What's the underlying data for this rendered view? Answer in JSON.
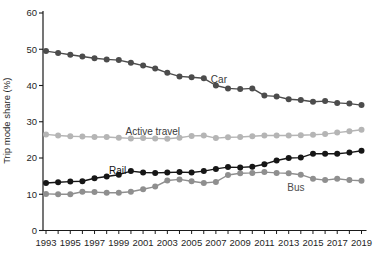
{
  "chart_data": {
    "type": "line",
    "title": "",
    "xlabel": "",
    "ylabel": "Trip mode share (%)",
    "ylim": [
      0,
      60
    ],
    "yticks": [
      0,
      10,
      20,
      30,
      40,
      50,
      60
    ],
    "xlim": [
      1993,
      2019
    ],
    "xtick_labels": [
      1993,
      1995,
      1997,
      1999,
      2001,
      2003,
      2005,
      2007,
      2009,
      2011,
      2013,
      2015,
      2017,
      2019
    ],
    "grid": false,
    "legend": "inline-annotations",
    "x": [
      1993,
      1994,
      1995,
      1996,
      1997,
      1998,
      1999,
      2000,
      2001,
      2002,
      2003,
      2004,
      2005,
      2006,
      2007,
      2008,
      2009,
      2010,
      2011,
      2012,
      2013,
      2014,
      2015,
      2016,
      2017,
      2018,
      2019
    ],
    "series": [
      {
        "name": "Car",
        "color": "#4c4c4c",
        "values": [
          49.5,
          49.0,
          48.5,
          48.0,
          47.5,
          47.2,
          47.0,
          46.3,
          45.5,
          44.7,
          43.5,
          42.5,
          42.3,
          42.0,
          40.0,
          39.2,
          39.0,
          39.2,
          37.2,
          37.0,
          36.2,
          36.0,
          35.5,
          35.7,
          35.2,
          35.0,
          34.6
        ]
      },
      {
        "name": "Active travel",
        "color": "#b5b5b5",
        "values": [
          26.5,
          26.2,
          26.0,
          25.9,
          25.8,
          25.8,
          25.6,
          25.4,
          25.5,
          25.4,
          25.3,
          25.6,
          26.1,
          26.2,
          25.5,
          25.7,
          25.8,
          26.0,
          26.2,
          26.2,
          26.2,
          26.3,
          26.4,
          26.6,
          27.0,
          27.4,
          27.8
        ]
      },
      {
        "name": "Bus",
        "color": "#8f8f8f",
        "values": [
          10.1,
          10.0,
          10.0,
          10.7,
          10.6,
          10.4,
          10.4,
          10.7,
          11.4,
          12.1,
          13.8,
          14.1,
          13.6,
          13.1,
          13.4,
          15.3,
          15.8,
          15.9,
          16.1,
          15.9,
          15.8,
          15.4,
          14.3,
          13.9,
          14.3,
          13.9,
          13.7
        ]
      },
      {
        "name": "Rail",
        "color": "#161616",
        "values": [
          13.1,
          13.3,
          13.5,
          13.6,
          14.4,
          14.9,
          15.4,
          16.4,
          16.0,
          15.9,
          16.0,
          16.1,
          16.0,
          16.4,
          17.0,
          17.5,
          17.4,
          17.6,
          18.3,
          19.3,
          20.0,
          20.1,
          21.2,
          21.2,
          21.2,
          21.5,
          22.0
        ]
      }
    ],
    "annotations": [
      {
        "text": "Car",
        "x": 2007.25,
        "y": 41.7,
        "color": "#3a3a3a"
      },
      {
        "text": "Active travel",
        "x": 2001.8,
        "y": 27.4,
        "color": "#3a3a3a"
      },
      {
        "text": "Rail",
        "x": 1998.9,
        "y": 16.6,
        "color": "#111111"
      },
      {
        "text": "Bus",
        "x": 2013.6,
        "y": 11.9,
        "color": "#4d4d4d"
      }
    ],
    "axis_color": "#1a1a1a",
    "tick_label_color": "#1f1f1f"
  }
}
